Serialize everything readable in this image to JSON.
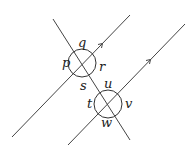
{
  "diagram": {
    "colors": {
      "line": "#444444",
      "text": "#222222",
      "background": "#ffffff"
    },
    "lines": [
      {
        "id": "parallel-1",
        "x1": 12,
        "y1": 137,
        "x2": 130,
        "y2": 15,
        "arrow_at": [
          102,
          44
        ]
      },
      {
        "id": "parallel-2",
        "x1": 68,
        "y1": 145,
        "x2": 185,
        "y2": 24,
        "arrow_at": [
          150,
          60
        ]
      },
      {
        "id": "transversal",
        "x1": 53,
        "y1": 19,
        "x2": 130,
        "y2": 140
      }
    ],
    "intersections": [
      {
        "id": "top",
        "cx": 82,
        "cy": 63,
        "r": 14
      },
      {
        "id": "bottom",
        "cx": 108,
        "cy": 104,
        "r": 14
      }
    ],
    "labels": {
      "p": {
        "text": "p",
        "x": 62,
        "y": 67
      },
      "q": {
        "text": "q",
        "x": 78,
        "y": 46
      },
      "r": {
        "text": "r",
        "x": 99,
        "y": 71
      },
      "s": {
        "text": "s",
        "x": 80,
        "y": 90
      },
      "u": {
        "text": "u",
        "x": 104,
        "y": 88
      },
      "t": {
        "text": "t",
        "x": 88,
        "y": 108
      },
      "v": {
        "text": "v",
        "x": 125,
        "y": 108
      },
      "w": {
        "text": "w",
        "x": 101,
        "y": 127
      }
    }
  }
}
